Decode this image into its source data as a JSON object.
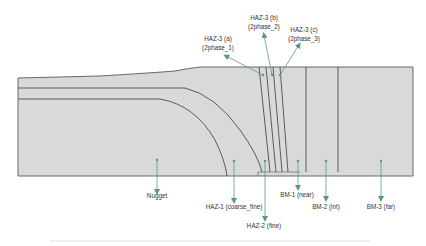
{
  "diagram": {
    "type": "weld cross-section zone map",
    "colors": {
      "background": "#ffffff",
      "specimen_fill": "#d9d9d9",
      "outline": "#595959",
      "zone_boundary": "#4d4d4d",
      "arrow": "#5b9a78",
      "label_text": "#333333"
    },
    "zones": [
      {
        "id": "nugget",
        "label": "Nugget"
      },
      {
        "id": "haz1",
        "label": "HAZ-1 (coarse_fine)"
      },
      {
        "id": "haz2",
        "label": "HAZ-2 (fine)"
      },
      {
        "id": "haz3a",
        "label_line1": "HAZ-3 (a)",
        "label_line2": "(2phase_1)"
      },
      {
        "id": "haz3b",
        "label_line1": "HAZ-3 (b)",
        "label_line2": "(2phase_2)"
      },
      {
        "id": "haz3c",
        "label_line1": "HAZ-3 (c)",
        "label_line2": "(2phase_3)"
      },
      {
        "id": "bm1",
        "label": "BM-1 (near)"
      },
      {
        "id": "bm2",
        "label": "BM-2 (int)"
      },
      {
        "id": "bm3",
        "label": "BM-3 (far)"
      }
    ]
  }
}
